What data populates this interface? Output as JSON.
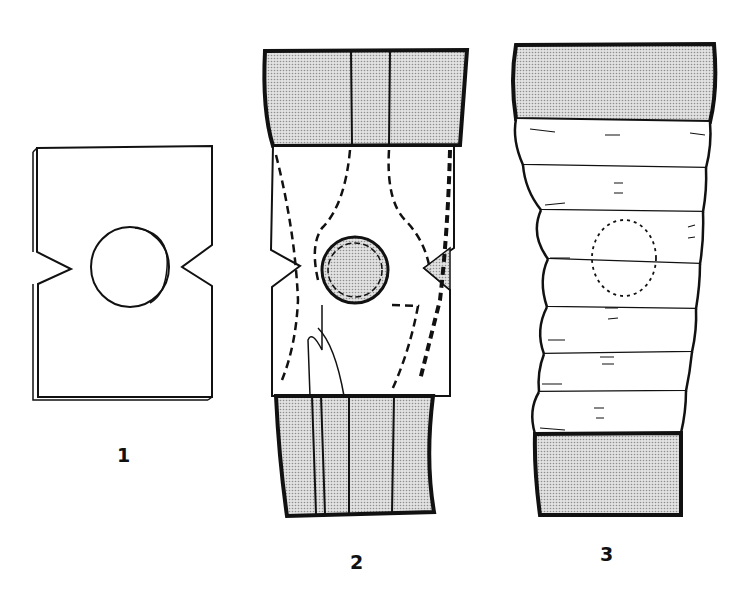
{
  "figures": [
    {
      "id": 1,
      "label": "1",
      "description": "Flat pad with circular hole and V-notches on both sides"
    },
    {
      "id": 2,
      "label": "2",
      "description": "Pad applied over knee with shaded leg sections and dashed outlines"
    },
    {
      "id": 3,
      "label": "3",
      "description": "Leg wrapped in overlapping bandage turns with dotted circle over knee"
    }
  ],
  "colors": {
    "stroke": "#111111",
    "shade": "#cfcfcf",
    "background": "#ffffff"
  }
}
